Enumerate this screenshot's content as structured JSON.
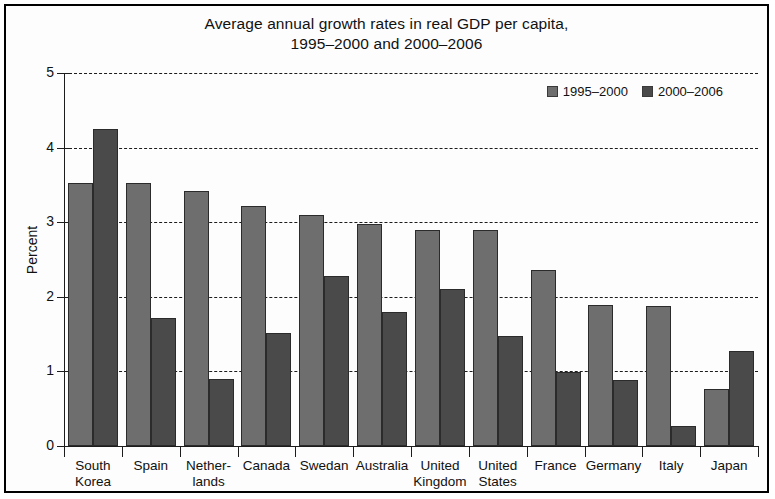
{
  "chart_data": {
    "type": "bar",
    "title": "Average annual growth rates in real GDP per capita, 1995–2000 and 2000–2006",
    "title_line1": "Average annual growth rates in real GDP per capita,",
    "title_line2": "1995–2000 and 2000–2006",
    "xlabel": "",
    "ylabel": "Percent",
    "ylim": [
      0,
      5
    ],
    "yticks": [
      0,
      1,
      2,
      3,
      4,
      5
    ],
    "ytick_labels": [
      "0",
      "1",
      "2",
      "3",
      "4",
      "5"
    ],
    "grid": true,
    "grid_style": "dashed-horizontal",
    "legend_position": "top-right",
    "categories": [
      "South Korea",
      "Spain",
      "Netherlands",
      "Canada",
      "Swedan",
      "Australia",
      "United Kingdom",
      "United States",
      "France",
      "Germany",
      "Italy",
      "Japan"
    ],
    "category_lines": [
      [
        "South",
        "Korea"
      ],
      [
        "Spain",
        ""
      ],
      [
        "Nether-",
        "lands"
      ],
      [
        "Canada",
        ""
      ],
      [
        "Swedan",
        ""
      ],
      [
        "Australia",
        ""
      ],
      [
        "United",
        "Kingdom"
      ],
      [
        "United",
        "States"
      ],
      [
        "France",
        ""
      ],
      [
        "Germany",
        ""
      ],
      [
        "Italy",
        ""
      ],
      [
        "Japan",
        ""
      ]
    ],
    "series": [
      {
        "name": "1995–2000",
        "color": "#6e6e6e",
        "values": [
          3.52,
          3.52,
          3.42,
          3.22,
          3.1,
          2.98,
          2.9,
          2.9,
          2.36,
          1.89,
          1.88,
          0.77
        ]
      },
      {
        "name": "2000–2006",
        "color": "#4a4a4a",
        "values": [
          4.25,
          1.71,
          0.9,
          1.51,
          2.28,
          1.79,
          2.1,
          1.48,
          0.99,
          0.88,
          0.27,
          1.27
        ]
      }
    ]
  },
  "legend": {
    "items": [
      {
        "label": "1995–2000",
        "color": "#6e6e6e"
      },
      {
        "label": "2000–2006",
        "color": "#4a4a4a"
      }
    ]
  }
}
